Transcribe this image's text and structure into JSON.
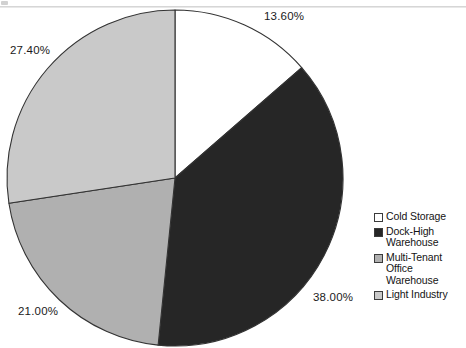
{
  "chart_data": {
    "type": "pie",
    "title": "",
    "subtitle": "",
    "xlabel": "",
    "ylabel": "",
    "legend_position": "right",
    "grid": false,
    "start_angle_deg": 0,
    "direction": "clockwise",
    "categories": [
      "Cold Storage",
      "Dock-High Warehouse",
      "Multi-Tenant Office Warehouse",
      "Light Industry"
    ],
    "values": [
      13.6,
      38.0,
      21.0,
      27.4
    ],
    "data_labels": [
      "13.60%",
      "38.00%",
      "21.00%",
      "27.40%"
    ],
    "slice_colors": [
      "#ffffff",
      "#262626",
      "#b0b0b0",
      "#c9c9c9"
    ],
    "slices": [
      {
        "label": "Cold Storage",
        "value": 13.6,
        "data_label": "13.60%",
        "color": "#ffffff"
      },
      {
        "label": "Dock-High Warehouse",
        "value": 38.0,
        "data_label": "38.00%",
        "color": "#262626"
      },
      {
        "label": "Multi-Tenant Office Warehouse",
        "value": 21.0,
        "data_label": "21.00%",
        "color": "#b0b0b0"
      },
      {
        "label": "Light Industry",
        "value": 27.4,
        "data_label": "27.40%",
        "color": "#c9c9c9"
      }
    ]
  },
  "legend": {
    "items": [
      {
        "label": "Cold Storage",
        "color": "#ffffff"
      },
      {
        "label": "Dock-High Warehouse",
        "color": "#262626"
      },
      {
        "label": "Multi-Tenant Office Warehouse",
        "color": "#b0b0b0"
      },
      {
        "label": "Light Industry",
        "color": "#c9c9c9"
      }
    ]
  },
  "styles": {
    "outline": "#333333",
    "background": "#ffffff",
    "label_color": "#1a1a1a"
  }
}
